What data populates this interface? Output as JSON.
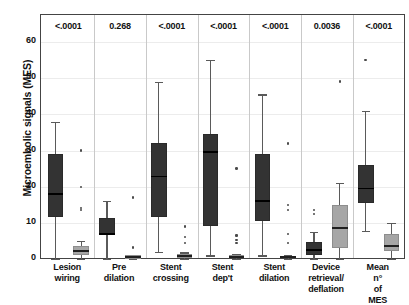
{
  "chart_data": {
    "type": "box",
    "title": "",
    "xlabel": "",
    "ylabel": "Microembolic signals (MES)",
    "ylim": [
      0,
      65
    ],
    "yticks": [
      0,
      10,
      20,
      30,
      40,
      50,
      60
    ],
    "ytick_labels": [
      "0",
      "10",
      "20",
      "30",
      "40",
      "50",
      "60"
    ],
    "grid": true,
    "legend": "none",
    "categories": [
      "Lesion wiring",
      "Pre dilation",
      "Stent crossing",
      "Stent dep't",
      "Stent dilation",
      "Device retrieval/ deflation",
      "Mean n° of MES"
    ],
    "annotations": {
      "label": "p-value",
      "values": [
        "<.0001",
        "0.268",
        "<.0001",
        "<.0001",
        "<.0001",
        "0.0036",
        "<.0001"
      ]
    },
    "series": [
      {
        "name": "dark",
        "color": "#333333",
        "boxes": [
          {
            "category": "Lesion wiring",
            "whisker_low": 0.0,
            "q1": 11.5,
            "median": 18.0,
            "q3": 29.0,
            "whisker_high": 38.0,
            "outliers": []
          },
          {
            "category": "Pre dilation",
            "whisker_low": 0.0,
            "q1": 6.8,
            "median": 7.0,
            "q3": 11.3,
            "whisker_high": 16.0,
            "outliers": []
          },
          {
            "category": "Stent crossing",
            "whisker_low": 2.0,
            "q1": 11.5,
            "median": 22.8,
            "q3": 32.0,
            "whisker_high": 49.0,
            "outliers": []
          },
          {
            "category": "Stent dep't",
            "whisker_low": 1.0,
            "q1": 9.0,
            "median": 29.5,
            "q3": 34.5,
            "whisker_high": 55.0,
            "outliers": []
          },
          {
            "category": "Stent dilation",
            "whisker_low": 1.0,
            "q1": 10.5,
            "median": 16.0,
            "q3": 29.0,
            "whisker_high": 45.5,
            "outliers": []
          },
          {
            "category": "Device retrieval/ deflation",
            "whisker_low": 0.0,
            "q1": 1.0,
            "median": 2.5,
            "q3": 4.8,
            "whisker_high": 7.5,
            "outliers": [
              12.5,
              13.5
            ]
          },
          {
            "category": "Mean n° of MES",
            "whisker_low": 7.8,
            "q1": 15.5,
            "median": 19.5,
            "q3": 26.0,
            "whisker_high": 41.0,
            "outliers": [
              55.0
            ]
          }
        ]
      },
      {
        "name": "light",
        "color": "#a6a6a6",
        "boxes": [
          {
            "category": "Lesion wiring",
            "whisker_low": 0.0,
            "q1": 1.2,
            "median": 2.2,
            "q3": 3.5,
            "whisker_high": 5.0,
            "outliers": [
              30.0,
              20.0,
              14.0,
              13.5
            ]
          },
          {
            "category": "Pre dilation",
            "whisker_low": 0.0,
            "q1": 0.0,
            "median": 0.5,
            "q3": 1.0,
            "whisker_high": 1.2,
            "outliers": [
              17.0,
              3.2
            ]
          },
          {
            "category": "Stent crossing",
            "whisker_low": 0.0,
            "q1": 0.3,
            "median": 0.8,
            "q3": 1.3,
            "whisker_high": 1.8,
            "outliers": [
              9.0,
              6.0,
              4.5
            ]
          },
          {
            "category": "Stent dep't",
            "whisker_low": 0.0,
            "q1": 0.2,
            "median": 0.6,
            "q3": 1.0,
            "whisker_high": 1.4,
            "outliers": [
              6.5,
              5.3,
              4.5,
              25.0
            ]
          },
          {
            "category": "Stent dilation",
            "whisker_low": 0.0,
            "q1": 0.2,
            "median": 0.5,
            "q3": 0.9,
            "whisker_high": 1.2,
            "outliers": [
              15.0,
              13.5,
              7.0,
              4.5,
              32.0
            ]
          },
          {
            "category": "Device retrieval/ deflation",
            "whisker_low": 0.0,
            "q1": 3.0,
            "median": 8.5,
            "q3": 15.0,
            "whisker_high": 21.0,
            "outliers": [
              49.0
            ]
          },
          {
            "category": "Mean n° of MES",
            "whisker_low": 0.0,
            "q1": 2.2,
            "median": 3.5,
            "q3": 7.0,
            "whisker_high": 10.0,
            "outliers": []
          }
        ]
      }
    ]
  }
}
